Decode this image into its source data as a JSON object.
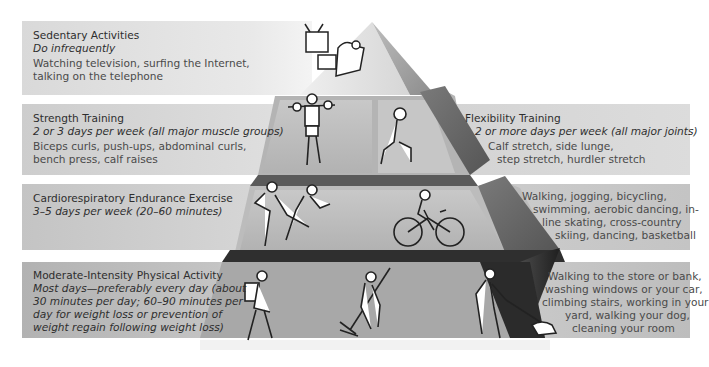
{
  "pyramid": {
    "levels": [
      {
        "id": "sedentary",
        "title": "Sedentary Activities",
        "frequency": "Do infrequently",
        "examples_lines": [
          "Watching television, surfing the Internet,",
          "talking on the telephone"
        ]
      },
      {
        "id": "strength",
        "title": "Strength Training",
        "frequency": "2 or 3 days per week  (all major muscle groups)",
        "examples_lines": [
          "Biceps curls, push-ups, abdominal curls,",
          "bench press, calf raises"
        ]
      },
      {
        "id": "flexibility",
        "title": "Flexibility Training",
        "frequency": "2 or more days per week (all major joints)",
        "examples_lines": [
          "Calf stretch, side lunge,",
          "step stretch, hurdler stretch"
        ]
      },
      {
        "id": "cardio",
        "title": "Cardiorespiratory  Endurance Exercise",
        "frequency": "3–5 days per week (20–60 minutes)",
        "examples_lines": [
          "Walking, jogging, bicycling,",
          "swimming, aerobic dancing, in-",
          "line skating, cross-country",
          "skiing, dancing, basketball"
        ]
      },
      {
        "id": "moderate",
        "title": "Moderate-Intensity Physical Activity",
        "frequency_lines": [
          "Most days—preferably every day (about",
          "30 minutes per day; 60–90 minutes per",
          "day for weight loss or prevention of",
          "weight regain following weight loss)"
        ],
        "examples_lines": [
          "Walking to the store or bank,",
          "washing windows or your car,",
          "climbing stairs, working in your",
          "yard, walking your dog,",
          "cleaning  your room"
        ]
      }
    ],
    "illustrations": [
      "tv-watching",
      "weightlifter",
      "lunge-stretch",
      "dancing-couple",
      "cyclist",
      "shopper-with-bags",
      "leaf-raker",
      "dog-walker"
    ]
  },
  "colors": {
    "band_1": "#dcdcdc",
    "band_2": "#cfcfcf",
    "band_3": "#c2c2c2",
    "band_4": "#b4b4b4",
    "pyramid_light": "#d8d8d8",
    "pyramid_mid": "#a9a9a9",
    "pyramid_dark": "#3a3a3a"
  }
}
